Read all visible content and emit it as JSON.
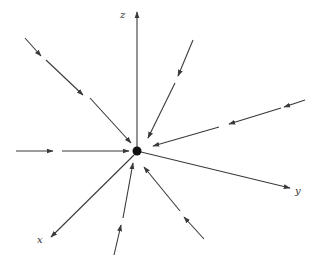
{
  "diagram": {
    "title": "",
    "colors": {
      "line": "#3a3a3a",
      "dot": "#111111",
      "label": "#333333",
      "background": "#ffffff"
    },
    "origin": {
      "x": 137,
      "y": 151,
      "r": 4.5
    },
    "axes": [
      {
        "name": "z",
        "label": "z",
        "from": [
          137,
          147
        ],
        "to": [
          137,
          12
        ],
        "label_pos": [
          120,
          18
        ]
      },
      {
        "name": "y",
        "label": "y",
        "from": [
          141,
          152
        ],
        "to": [
          290,
          188
        ],
        "label_pos": [
          295,
          194
        ]
      },
      {
        "name": "x",
        "label": "x",
        "from": [
          134,
          155
        ],
        "to": [
          51,
          237
        ],
        "label_pos": [
          37,
          243
        ]
      }
    ],
    "field_lines": [
      {
        "name": "upper-left",
        "segments": [
          [
            [
              25,
              38
            ],
            [
              41,
              56
            ]
          ],
          [
            [
              46,
              60
            ],
            [
              83,
              95
            ]
          ],
          [
            [
              90,
              98
            ],
            [
              131,
              143
            ]
          ]
        ]
      },
      {
        "name": "left",
        "segments": [
          [
            [
              16,
              151
            ],
            [
              53,
              151
            ]
          ],
          [
            [
              62,
              151
            ],
            [
              129,
              151
            ]
          ]
        ]
      },
      {
        "name": "upper-right-steep",
        "segments": [
          [
            [
              193,
              40
            ],
            [
              178,
              76
            ]
          ],
          [
            [
              175,
              83
            ],
            [
              148,
              138
            ]
          ]
        ]
      },
      {
        "name": "right-shallow",
        "segments": [
          [
            [
              305,
              100
            ],
            [
              284,
              107
            ]
          ],
          [
            [
              281,
              108
            ],
            [
              229,
              124
            ]
          ],
          [
            [
              219,
              127
            ],
            [
              153,
              146
            ]
          ]
        ]
      },
      {
        "name": "bottom-center",
        "segments": [
          [
            [
              114,
              255
            ],
            [
              121,
              225
            ]
          ],
          [
            [
              123,
              218
            ],
            [
              133,
              163
            ]
          ]
        ]
      },
      {
        "name": "bottom-right",
        "segments": [
          [
            [
              204,
              239
            ],
            [
              184,
              217
            ]
          ],
          [
            [
              180,
              211
            ],
            [
              144,
              167
            ]
          ]
        ]
      }
    ]
  }
}
